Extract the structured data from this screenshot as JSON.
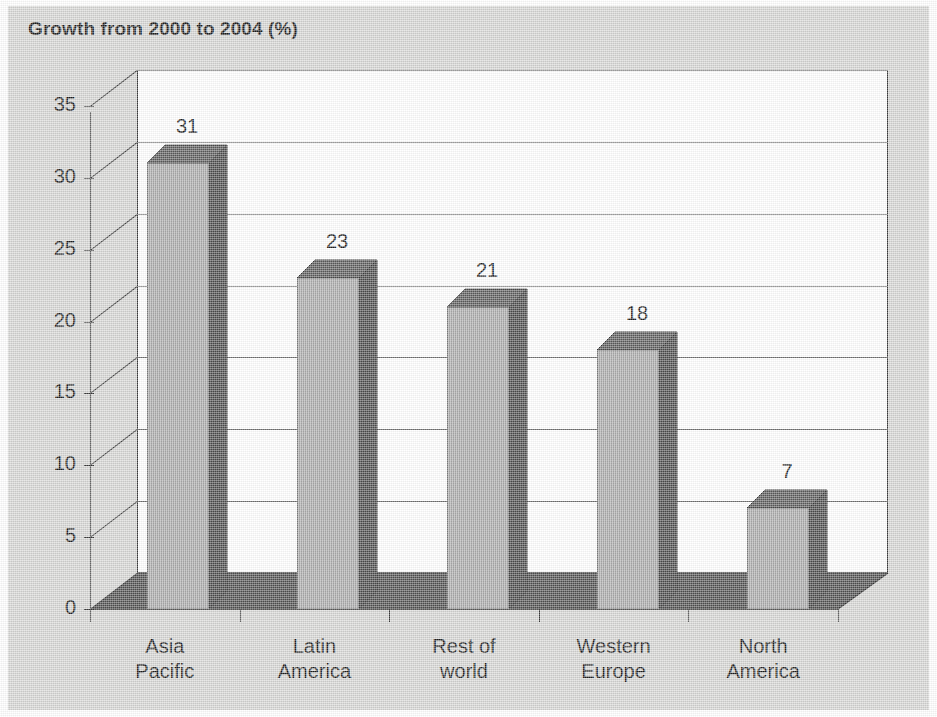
{
  "chart_data": {
    "type": "bar",
    "title": "Growth from 2000 to 2004 (%)",
    "xlabel": "",
    "ylabel": "",
    "categories": [
      "Asia Pacific",
      "Latin America",
      "Rest of world",
      "Western Europe",
      "North America"
    ],
    "category_lines": [
      [
        "Asia",
        "Pacific"
      ],
      [
        "Latin",
        "America"
      ],
      [
        "Rest of",
        "world"
      ],
      [
        "Western",
        "Europe"
      ],
      [
        "North",
        "America"
      ]
    ],
    "values": [
      31,
      23,
      21,
      18,
      7
    ],
    "value_labels": [
      "31",
      "23",
      "21",
      "18",
      "7"
    ],
    "ylim": [
      0,
      35
    ],
    "yticks": [
      0,
      5,
      10,
      15,
      20,
      25,
      30,
      35
    ],
    "ytick_labels": [
      "0",
      "5",
      "10",
      "15",
      "20",
      "25",
      "30",
      "35"
    ],
    "grid": true,
    "legend": false,
    "style": "3d-column",
    "units": "%"
  },
  "colors": {
    "background": "#d5d5d3",
    "plot_background": "#ffffff",
    "bar_front": "#a3a3a3",
    "bar_side": "#4b4b4b",
    "bar_top": "#5b5b5b",
    "floor": "#4f4f4f",
    "axis": "#3a3a3a",
    "gridline": "#6e6e6e",
    "text": "#1d1d1d"
  }
}
